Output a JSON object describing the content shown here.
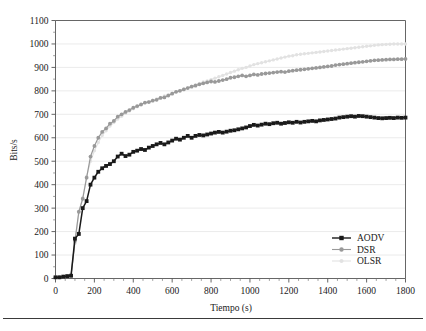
{
  "figure": {
    "background_color": "#ffffff",
    "has_bottom_rule": true
  },
  "axes": {
    "x_title": "Tiempo (s)",
    "y_title": "Bits/s",
    "x_ticks": [
      "0",
      "200",
      "400",
      "600",
      "800",
      "1000",
      "1200",
      "1400",
      "1600",
      "1800"
    ],
    "y_ticks": [
      "0",
      "100",
      "200",
      "300",
      "400",
      "500",
      "600",
      "700",
      "800",
      "900",
      "1000",
      "1100"
    ]
  },
  "legend": {
    "position": "bottom-right-inside",
    "entries": [
      {
        "label": "AODV",
        "color": "#1a1a1a",
        "marker": "square"
      },
      {
        "label": "DSR",
        "color": "#999999",
        "marker": "circle"
      },
      {
        "label": "OLSR",
        "color": "#e2e2e2",
        "marker": "triangle"
      }
    ]
  },
  "chart_data": {
    "type": "line",
    "title": "",
    "subtitle": "",
    "xlabel": "Tiempo (s)",
    "ylabel": "Bits/s",
    "xlim": [
      0,
      1800
    ],
    "ylim": [
      0,
      1100
    ],
    "x_tick_step": 200,
    "y_tick_step": 100,
    "x_minor_ticks_per_interval": 4,
    "y_minor_ticks_per_interval": 2,
    "grid": "horizontal",
    "legend_position": "lower right",
    "annotations": [],
    "x": [
      0,
      20,
      40,
      60,
      80,
      100,
      120,
      140,
      160,
      180,
      200,
      220,
      240,
      260,
      280,
      300,
      320,
      340,
      360,
      380,
      400,
      420,
      440,
      460,
      480,
      500,
      520,
      540,
      560,
      580,
      600,
      620,
      640,
      660,
      680,
      700,
      720,
      740,
      760,
      780,
      800,
      820,
      840,
      860,
      880,
      900,
      920,
      940,
      960,
      980,
      1000,
      1020,
      1040,
      1060,
      1080,
      1100,
      1120,
      1140,
      1160,
      1180,
      1200,
      1220,
      1240,
      1260,
      1280,
      1300,
      1320,
      1340,
      1360,
      1380,
      1400,
      1420,
      1440,
      1460,
      1480,
      1500,
      1520,
      1540,
      1560,
      1580,
      1600,
      1620,
      1640,
      1660,
      1680,
      1700,
      1720,
      1740,
      1760,
      1780,
      1800
    ],
    "series": [
      {
        "name": "AODV",
        "color": "#1a1a1a",
        "marker": "square",
        "values": [
          5,
          5,
          8,
          10,
          12,
          170,
          190,
          300,
          330,
          400,
          430,
          455,
          470,
          480,
          488,
          500,
          520,
          532,
          522,
          528,
          540,
          545,
          552,
          548,
          558,
          565,
          572,
          578,
          572,
          580,
          588,
          596,
          592,
          600,
          608,
          600,
          608,
          612,
          610,
          614,
          618,
          622,
          625,
          622,
          626,
          630,
          632,
          636,
          640,
          644,
          650,
          655,
          652,
          656,
          660,
          658,
          662,
          664,
          660,
          663,
          666,
          664,
          668,
          665,
          668,
          670,
          672,
          670,
          674,
          676,
          678,
          680,
          682,
          686,
          688,
          690,
          692,
          690,
          693,
          692,
          690,
          688,
          686,
          684,
          683,
          684,
          685,
          684,
          686,
          685,
          686
        ]
      },
      {
        "name": "DSR",
        "color": "#999999",
        "marker": "circle",
        "values": [
          5,
          5,
          8,
          10,
          12,
          160,
          285,
          340,
          430,
          520,
          565,
          600,
          625,
          640,
          660,
          672,
          690,
          700,
          710,
          718,
          728,
          735,
          742,
          750,
          752,
          758,
          762,
          770,
          772,
          780,
          788,
          796,
          800,
          806,
          812,
          818,
          822,
          828,
          832,
          836,
          840,
          838,
          842,
          846,
          850,
          856,
          858,
          862,
          866,
          862,
          866,
          870,
          868,
          872,
          874,
          876,
          878,
          880,
          882,
          880,
          884,
          886,
          888,
          890,
          892,
          894,
          896,
          898,
          900,
          902,
          904,
          906,
          910,
          912,
          914,
          916,
          918,
          920,
          922,
          924,
          926,
          928,
          930,
          931,
          932,
          933,
          934,
          934,
          935,
          935,
          936
        ]
      },
      {
        "name": "OLSR",
        "color": "#e2e2e2",
        "marker": "triangle",
        "values": [
          5,
          5,
          8,
          10,
          12,
          150,
          280,
          345,
          435,
          500,
          545,
          580,
          610,
          630,
          650,
          665,
          680,
          692,
          704,
          714,
          724,
          732,
          740,
          748,
          754,
          760,
          766,
          772,
          778,
          784,
          790,
          796,
          802,
          808,
          814,
          820,
          826,
          832,
          838,
          842,
          848,
          854,
          860,
          866,
          872,
          878,
          884,
          890,
          896,
          900,
          906,
          912,
          916,
          920,
          924,
          928,
          932,
          936,
          940,
          944,
          948,
          950,
          954,
          956,
          958,
          960,
          962,
          964,
          966,
          968,
          970,
          972,
          974,
          976,
          978,
          980,
          982,
          984,
          986,
          988,
          990,
          992,
          994,
          996,
          997,
          998,
          999,
          1000,
          1000,
          1000,
          1000
        ]
      }
    ]
  }
}
